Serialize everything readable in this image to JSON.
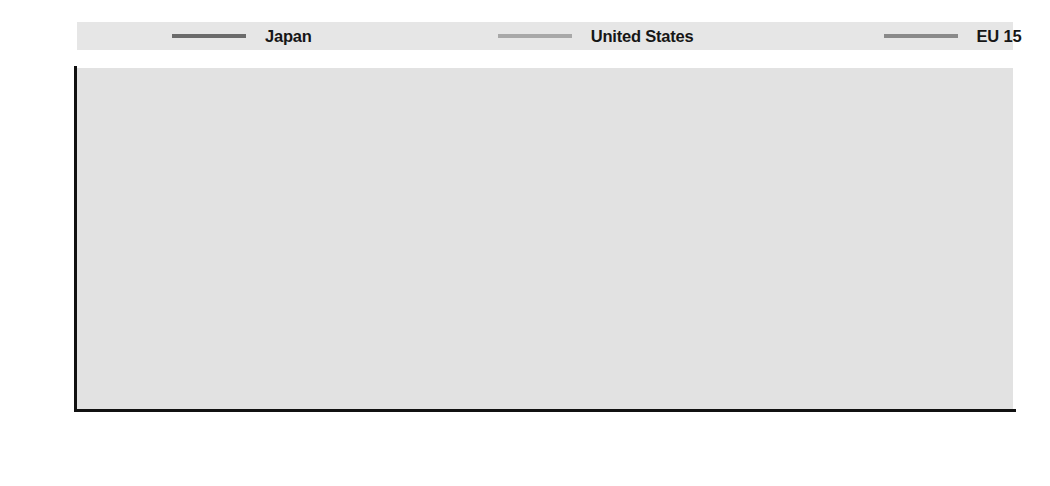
{
  "legend": {
    "position": "top",
    "entries": [
      {
        "label": "Japan",
        "color": "#6b6b6b",
        "swatch_name": "legend-swatch-japan"
      },
      {
        "label": "United States",
        "color": "#a8a8a8",
        "swatch_name": "legend-swatch-united-states"
      },
      {
        "label": "EU 15",
        "color": "#8a8a8a",
        "swatch_name": "legend-swatch-eu-15"
      }
    ]
  },
  "axes": {
    "y_ticks": [
      "2 200",
      "2 100",
      "2 000",
      "1 900",
      "1 800",
      "1 700",
      "1 600",
      "1 500"
    ],
    "y_values": [
      2200,
      2100,
      2000,
      1900,
      1800,
      1700,
      1600,
      1500
    ],
    "x_ticks": [
      "1987",
      "1988",
      "1989",
      "1990",
      "1991",
      "1992",
      "1993",
      "1994",
      "1995",
      "1996",
      "1997",
      "1998",
      "1999",
      "2000",
      "2001",
      "2002",
      "2003",
      "2004",
      "2005",
      "2006"
    ]
  },
  "style": {
    "plot_background": "#e2e2e2",
    "gridline_color": "#ffffff",
    "axis_color": "#111111",
    "legend_background": "#e6e6e6"
  },
  "chart_data": {
    "type": "line",
    "title": "",
    "subtitle": "",
    "xlabel": "",
    "ylabel": "",
    "xlim": [
      1987,
      2006
    ],
    "ylim": [
      1500,
      2200
    ],
    "grid": true,
    "legend_position": "top",
    "x": [
      1987,
      1988,
      1989,
      1990,
      1991,
      1992,
      1993,
      1994,
      1995,
      1996,
      1997,
      1998,
      1999,
      2000,
      2001,
      2002,
      2003,
      2004,
      2005,
      2006
    ],
    "categories": [
      "1987",
      "1988",
      "1989",
      "1990",
      "1991",
      "1992",
      "1993",
      "1994",
      "1995",
      "1996",
      "1997",
      "1998",
      "1999",
      "2000",
      "2001",
      "2002",
      "2003",
      "2004",
      "2005",
      "2006"
    ],
    "series": [
      {
        "name": "Japan",
        "color": "#6b6b6b",
        "values": [
          2095,
          2090,
          2065,
          2025,
          1985,
          1955,
          1900,
          1895,
          1885,
          1888,
          1858,
          1838,
          1798,
          1815,
          1800,
          1790,
          1785,
          1778,
          1762,
          1768
        ]
      },
      {
        "name": "United States",
        "color": "#a8a8a8",
        "values": [
          1840,
          1845,
          1855,
          1832,
          1822,
          1824,
          1832,
          1840,
          1845,
          1838,
          1843,
          1845,
          1843,
          1835,
          1815,
          1800,
          1792,
          1790,
          1787,
          1788
        ]
      },
      {
        "name": "EU 15",
        "color": "#8a8a8a",
        "values": [
          1782,
          1784,
          1780,
          1768,
          1740,
          1731,
          1722,
          1716,
          1712,
          1705,
          1697,
          1688,
          1678,
          1665,
          1658,
          1650,
          1644,
          1640,
          1638,
          1610
        ]
      }
    ]
  }
}
